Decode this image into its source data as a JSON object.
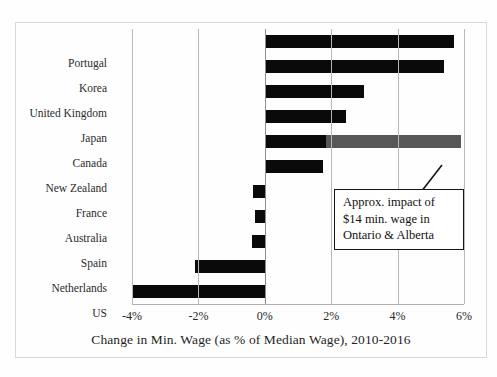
{
  "top_sliver_text": "",
  "chart_data": {
    "type": "bar",
    "orientation": "horizontal",
    "title": "",
    "xlabel": "Change in Min. Wage (as % of Median Wage), 2010-2016",
    "ylabel": "",
    "xlim": [
      -4,
      6
    ],
    "xticks": [
      -4,
      -2,
      0,
      2,
      4,
      6
    ],
    "xtick_labels": [
      "-4%",
      "-2%",
      "0%",
      "2%",
      "4%",
      "6%"
    ],
    "grid": "vertical",
    "legend": "none",
    "categories": [
      "Portugal",
      "Korea",
      "United Kingdom",
      "Japan",
      "Canada",
      "New Zealand",
      "France",
      "Australia",
      "Spain",
      "Netherlands",
      "US"
    ],
    "values": [
      5.7,
      5.4,
      3.0,
      2.45,
      1.85,
      1.75,
      -0.35,
      -0.3,
      -0.4,
      -2.1,
      -4.0
    ],
    "series": [
      {
        "name": "Change in Min. Wage",
        "color": "#0a0a0a",
        "values": [
          5.7,
          5.4,
          3.0,
          2.45,
          1.85,
          1.75,
          -0.35,
          -0.3,
          -0.4,
          -2.1,
          -4.0
        ]
      },
      {
        "name": "Approx. impact of $14 min. wage in Ontario & Alberta",
        "color": "#575757",
        "category": "Canada",
        "from": 1.85,
        "to": 5.9
      }
    ],
    "annotations": [
      {
        "target_category": "Canada",
        "lines": [
          "Approx. impact of",
          "$14 min. wage in",
          "Ontario & Alberta"
        ],
        "leader_line": true
      }
    ],
    "colors": {
      "bar": "#0a0a0a",
      "bar_extension": "#575757",
      "gridline": "#b8b8b8",
      "frame": "#d8d8d8",
      "background": "#fefefe"
    }
  }
}
